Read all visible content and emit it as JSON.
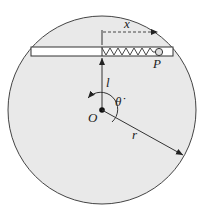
{
  "diagram": {
    "labels": {
      "x": "x",
      "P": "P",
      "l": "l",
      "theta_dot": "θ̇",
      "O": "O",
      "r": "r"
    },
    "colors": {
      "disk_fill": "#e9e9e9",
      "stroke": "#333333",
      "tube_fill": "#ffffff"
    }
  }
}
